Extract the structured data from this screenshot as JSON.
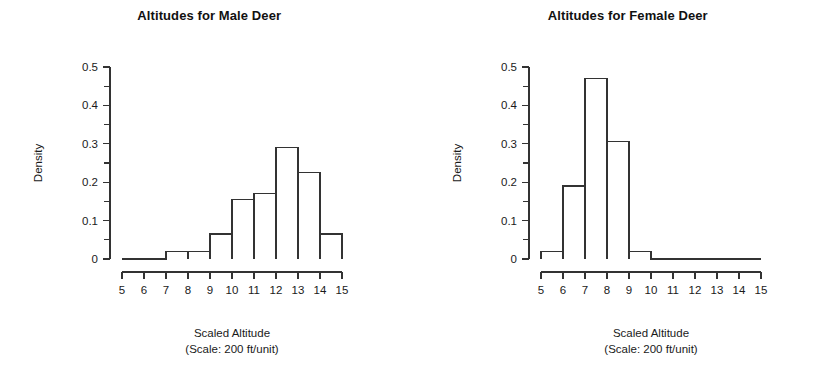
{
  "figure": {
    "background": "#ffffff",
    "line_color": "#333333",
    "text_color": "#1a1a1a"
  },
  "panels": [
    {
      "key": "male",
      "title": "Altitudes for Male Deer",
      "ylabel": "Density",
      "xlabel_line1": "Scaled Altitude",
      "xlabel_line2": "(Scale: 200 ft/unit)",
      "y_ticks": [
        "0",
        "0.1",
        "0.2",
        "0.3",
        "0.4",
        "0.5"
      ],
      "x_ticks": [
        "5",
        "6",
        "7",
        "8",
        "9",
        "10",
        "11",
        "12",
        "13",
        "14",
        "15"
      ]
    },
    {
      "key": "female",
      "title": "Altitudes for Female Deer",
      "ylabel": "Density",
      "xlabel_line1": "Scaled Altitude",
      "xlabel_line2": "(Scale: 200 ft/unit)",
      "y_ticks": [
        "0",
        "0.1",
        "0.2",
        "0.3",
        "0.4",
        "0.5"
      ],
      "x_ticks": [
        "5",
        "6",
        "7",
        "8",
        "9",
        "10",
        "11",
        "12",
        "13",
        "14",
        "15"
      ]
    }
  ],
  "chart_data": [
    {
      "type": "bar",
      "subtype": "histogram",
      "key": "male",
      "title": "Altitudes for Male Deer",
      "xlabel": "Scaled Altitude (Scale: 200 ft/unit)",
      "ylabel": "Density",
      "bin_edges": [
        5,
        6,
        7,
        8,
        9,
        10,
        11,
        12,
        13,
        14,
        15
      ],
      "categories": [
        "5-6",
        "6-7",
        "7-8",
        "8-9",
        "9-10",
        "10-11",
        "11-12",
        "12-13",
        "13-14",
        "14-15"
      ],
      "values": [
        0,
        0,
        0.02,
        0.02,
        0.065,
        0.155,
        0.17,
        0.29,
        0.225,
        0.065
      ],
      "xlim": [
        5,
        15
      ],
      "ylim": [
        0,
        0.5
      ],
      "y_tick_values": [
        0,
        0.1,
        0.2,
        0.3,
        0.4,
        0.5
      ],
      "y_minor_tick_values": [
        0.05,
        0.15,
        0.25,
        0.35,
        0.45
      ],
      "x_tick_values": [
        5,
        6,
        7,
        8,
        9,
        10,
        11,
        12,
        13,
        14,
        15
      ],
      "grid": false,
      "legend": false
    },
    {
      "type": "bar",
      "subtype": "histogram",
      "key": "female",
      "title": "Altitudes for Female Deer",
      "xlabel": "Scaled Altitude (Scale: 200 ft/unit)",
      "ylabel": "Density",
      "bin_edges": [
        5,
        6,
        7,
        8,
        9,
        10,
        11,
        12,
        13,
        14,
        15
      ],
      "categories": [
        "5-6",
        "6-7",
        "7-8",
        "8-9",
        "9-10",
        "10-11",
        "11-12",
        "12-13",
        "13-14",
        "14-15"
      ],
      "values": [
        0.02,
        0.19,
        0.47,
        0.305,
        0.02,
        0,
        0,
        0,
        0,
        0
      ],
      "xlim": [
        5,
        15
      ],
      "ylim": [
        0,
        0.5
      ],
      "y_tick_values": [
        0,
        0.1,
        0.2,
        0.3,
        0.4,
        0.5
      ],
      "y_minor_tick_values": [
        0.05,
        0.15,
        0.25,
        0.35,
        0.45
      ],
      "x_tick_values": [
        5,
        6,
        7,
        8,
        9,
        10,
        11,
        12,
        13,
        14,
        15
      ],
      "grid": false,
      "legend": false
    }
  ]
}
